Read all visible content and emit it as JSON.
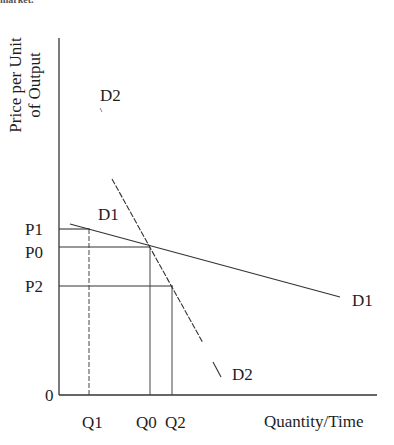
{
  "header_fragment": "market.",
  "axes": {
    "y_label_line1": "Price per Unit",
    "y_label_line2": "of Output",
    "x_label": "Quantity/Time",
    "origin_label": "0"
  },
  "price_levels": [
    {
      "label": "P1"
    },
    {
      "label": "P0"
    },
    {
      "label": "P2"
    }
  ],
  "quantity_levels": [
    {
      "label": "Q1"
    },
    {
      "label": "Q0"
    },
    {
      "label": "Q2"
    }
  ],
  "curves": {
    "d1_left": "D1",
    "d1_right": "D1",
    "d2_top": "D2",
    "d2_bottom": "D2"
  },
  "colors": {
    "line": "#333333",
    "text": "#1e1e1e",
    "background": "#ffffff"
  }
}
